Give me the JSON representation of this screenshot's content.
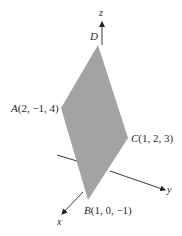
{
  "figure": {
    "fill_color": "#a3a3a3",
    "line_color": "#222222",
    "background": "#ffffff"
  },
  "axes": {
    "x_label": "x",
    "y_label": "y",
    "z_label": "z"
  },
  "points": [
    {
      "name": "A",
      "coords": "(2, −1, 4)"
    },
    {
      "name": "B",
      "coords": "(1, 0, −1)"
    },
    {
      "name": "C",
      "coords": "(1, 2, 3)"
    },
    {
      "name": "D",
      "coords": ""
    }
  ]
}
